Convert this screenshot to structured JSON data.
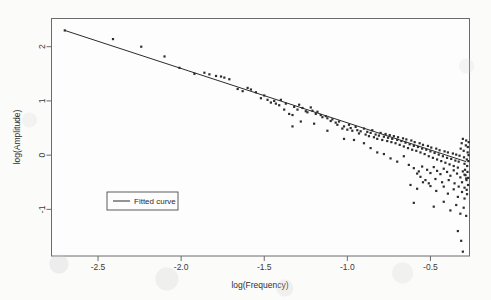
{
  "chart_data": {
    "type": "scatter",
    "title": "",
    "xlabel": "log(Frequency)",
    "ylabel": "log(Amplitude)",
    "xlim": [
      -2.78,
      -0.265
    ],
    "ylim": [
      -1.86,
      2.52
    ],
    "grid": false,
    "legend": {
      "position": "inner-left-lower",
      "entries": [
        {
          "label": "Fitted curve",
          "marker": "line",
          "color": "#2b2b2b"
        }
      ]
    },
    "xticks": [
      -2.5,
      -2.0,
      -1.5,
      -1.0,
      -0.5
    ],
    "xtick_labels": [
      "-2.5",
      "-2.0",
      "-1.5",
      "-1.0",
      "-0.5"
    ],
    "yticks": [
      2,
      1,
      0,
      -1
    ],
    "ytick_labels": [
      "2",
      "1",
      "0",
      "-1"
    ],
    "series": [
      {
        "name": "observations",
        "type": "scatter",
        "marker": "square",
        "marker_size": 2.2,
        "color": "#2d2d2d",
        "points": [
          [
            -2.7,
            2.3
          ],
          [
            -2.41,
            2.14
          ],
          [
            -2.24,
            2.0
          ],
          [
            -2.1,
            1.82
          ],
          [
            -2.01,
            1.61
          ],
          [
            -1.92,
            1.5
          ],
          [
            -1.86,
            1.52
          ],
          [
            -1.83,
            1.49
          ],
          [
            -1.79,
            1.46
          ],
          [
            -1.76,
            1.45
          ],
          [
            -1.74,
            1.43
          ],
          [
            -1.71,
            1.4
          ],
          [
            -1.66,
            1.22
          ],
          [
            -1.63,
            1.18
          ],
          [
            -1.6,
            1.24
          ],
          [
            -1.58,
            1.21
          ],
          [
            -1.55,
            1.16
          ],
          [
            -1.52,
            1.05
          ],
          [
            -1.5,
            1.1
          ],
          [
            -1.48,
            1.02
          ],
          [
            -1.46,
            0.97
          ],
          [
            -1.44,
            1.0
          ],
          [
            -1.43,
            0.95
          ],
          [
            -1.41,
            0.92
          ],
          [
            -1.4,
            1.02
          ],
          [
            -1.38,
            0.84
          ],
          [
            -1.37,
            0.95
          ],
          [
            -1.35,
            0.76
          ],
          [
            -1.33,
            0.74
          ],
          [
            -1.32,
            0.89
          ],
          [
            -1.3,
            0.84
          ],
          [
            -1.29,
            0.93
          ],
          [
            -1.27,
            0.87
          ],
          [
            -1.25,
            0.81
          ],
          [
            -1.24,
            0.79
          ],
          [
            -1.22,
            0.88
          ],
          [
            -1.21,
            0.82
          ],
          [
            -1.19,
            0.76
          ],
          [
            -1.18,
            0.8
          ],
          [
            -1.16,
            0.74
          ],
          [
            -1.15,
            0.7
          ],
          [
            -1.13,
            0.72
          ],
          [
            -1.12,
            0.68
          ],
          [
            -1.1,
            0.63
          ],
          [
            -1.09,
            0.66
          ],
          [
            -1.07,
            0.6
          ],
          [
            -1.06,
            0.56
          ],
          [
            -1.05,
            0.62
          ],
          [
            -1.03,
            0.49
          ],
          [
            -1.02,
            0.53
          ],
          [
            -1.0,
            0.47
          ],
          [
            -0.99,
            0.56
          ],
          [
            -0.98,
            0.5
          ],
          [
            -0.97,
            0.45
          ],
          [
            -0.95,
            0.52
          ],
          [
            -0.94,
            0.46
          ],
          [
            -0.93,
            0.4
          ],
          [
            -0.92,
            0.44
          ],
          [
            -0.9,
            0.49
          ],
          [
            -0.89,
            0.38
          ],
          [
            -0.88,
            0.43
          ],
          [
            -0.87,
            0.35
          ],
          [
            -0.86,
            0.41
          ],
          [
            -0.85,
            0.46
          ],
          [
            -0.84,
            0.33
          ],
          [
            -0.83,
            0.38
          ],
          [
            -0.82,
            0.3
          ],
          [
            -0.81,
            0.36
          ],
          [
            -0.8,
            0.41
          ],
          [
            -0.79,
            0.28
          ],
          [
            -0.78,
            0.34
          ],
          [
            -0.77,
            0.39
          ],
          [
            -0.76,
            0.26
          ],
          [
            -0.755,
            0.32
          ],
          [
            -0.745,
            0.37
          ],
          [
            -0.735,
            0.24
          ],
          [
            -0.73,
            0.3
          ],
          [
            -0.72,
            0.35
          ],
          [
            -0.71,
            0.22
          ],
          [
            -0.7,
            0.28
          ],
          [
            -0.695,
            0.33
          ],
          [
            -0.685,
            0.19
          ],
          [
            -0.675,
            0.26
          ],
          [
            -0.665,
            0.31
          ],
          [
            -0.66,
            0.16
          ],
          [
            -0.65,
            0.23
          ],
          [
            -0.645,
            0.29
          ],
          [
            -0.635,
            0.13
          ],
          [
            -0.625,
            0.2
          ],
          [
            -0.615,
            0.27
          ],
          [
            -0.61,
            0.1
          ],
          [
            -0.6,
            0.17
          ],
          [
            -0.595,
            0.24
          ],
          [
            -0.585,
            0.08
          ],
          [
            -0.575,
            0.15
          ],
          [
            -0.565,
            0.22
          ],
          [
            -0.56,
            0.05
          ],
          [
            -0.55,
            0.12
          ],
          [
            -0.545,
            0.19
          ],
          [
            -0.535,
            0.02
          ],
          [
            -0.525,
            0.1
          ],
          [
            -0.515,
            0.17
          ],
          [
            -0.51,
            -0.02
          ],
          [
            -0.5,
            0.07
          ],
          [
            -0.495,
            0.14
          ],
          [
            -0.485,
            -0.05
          ],
          [
            -0.475,
            0.04
          ],
          [
            -0.465,
            0.12
          ],
          [
            -0.46,
            -0.08
          ],
          [
            -0.45,
            0.01
          ],
          [
            -0.445,
            0.09
          ],
          [
            -0.435,
            -0.11
          ],
          [
            -0.425,
            -0.02
          ],
          [
            -0.415,
            0.07
          ],
          [
            -0.41,
            -0.14
          ],
          [
            -0.4,
            -0.05
          ],
          [
            -0.395,
            0.05
          ],
          [
            -0.385,
            -0.17
          ],
          [
            -0.375,
            -0.07
          ],
          [
            -0.365,
            0.03
          ],
          [
            -0.36,
            -0.2
          ],
          [
            -0.35,
            -0.1
          ],
          [
            -0.345,
            0.01
          ],
          [
            -0.335,
            -0.23
          ],
          [
            -0.33,
            -0.12
          ],
          [
            -0.325,
            -0.01
          ],
          [
            -0.318,
            0.12
          ],
          [
            -0.312,
            0.22
          ],
          [
            -0.305,
            0.3
          ],
          [
            -0.3,
            0.08
          ],
          [
            -0.298,
            -0.04
          ],
          [
            -0.295,
            -0.16
          ],
          [
            -0.292,
            -0.27
          ],
          [
            -0.289,
            -0.37
          ],
          [
            -0.287,
            0.18
          ],
          [
            -0.285,
            0.27
          ],
          [
            -0.283,
            -0.46
          ],
          [
            -0.281,
            -0.08
          ],
          [
            -0.279,
            -0.2
          ],
          [
            -0.277,
            -0.31
          ],
          [
            -0.276,
            0.05
          ],
          [
            -0.275,
            0.15
          ],
          [
            -0.274,
            -0.55
          ],
          [
            -0.273,
            -0.42
          ],
          [
            -0.272,
            -0.11
          ],
          [
            -0.271,
            0.0
          ],
          [
            -0.27,
            0.24
          ],
          [
            -1.33,
            0.53
          ],
          [
            -1.28,
            0.62
          ],
          [
            -1.2,
            0.58
          ],
          [
            -1.12,
            0.45
          ],
          [
            -1.02,
            0.3
          ],
          [
            -0.96,
            0.28
          ],
          [
            -0.9,
            0.22
          ],
          [
            -0.86,
            0.13
          ],
          [
            -0.82,
            0.05
          ],
          [
            -0.78,
            0.02
          ],
          [
            -0.74,
            -0.06
          ],
          [
            -0.7,
            -0.12
          ],
          [
            -0.66,
            -0.02
          ],
          [
            -0.63,
            -0.18
          ],
          [
            -0.6,
            -0.24
          ],
          [
            -0.57,
            -0.3
          ],
          [
            -0.55,
            -0.21
          ],
          [
            -0.52,
            -0.27
          ],
          [
            -0.5,
            -0.33
          ],
          [
            -0.48,
            -0.22
          ],
          [
            -0.46,
            -0.29
          ],
          [
            -0.44,
            -0.35
          ],
          [
            -0.42,
            -0.25
          ],
          [
            -0.4,
            -0.31
          ],
          [
            -0.38,
            -0.38
          ],
          [
            -0.36,
            -0.28
          ],
          [
            -0.34,
            -0.34
          ],
          [
            -0.32,
            -0.41
          ],
          [
            -0.305,
            -0.3
          ],
          [
            -0.295,
            -0.36
          ],
          [
            -0.285,
            -0.43
          ],
          [
            -0.62,
            -0.55
          ],
          [
            -0.58,
            -0.62
          ],
          [
            -0.545,
            -0.5
          ],
          [
            -0.5,
            -0.57
          ],
          [
            -0.465,
            -0.66
          ],
          [
            -0.42,
            -0.58
          ],
          [
            -0.395,
            -0.71
          ],
          [
            -0.36,
            -0.63
          ],
          [
            -0.335,
            -0.77
          ],
          [
            -0.31,
            -0.68
          ],
          [
            -0.295,
            -0.8
          ],
          [
            -0.28,
            -0.72
          ],
          [
            -0.6,
            -0.88
          ],
          [
            -0.48,
            -0.95
          ],
          [
            -0.42,
            -0.86
          ],
          [
            -0.38,
            -1.02
          ],
          [
            -0.345,
            -0.92
          ],
          [
            -0.32,
            -1.08
          ],
          [
            -0.3,
            -0.97
          ],
          [
            -0.285,
            -1.12
          ],
          [
            -0.335,
            -1.4
          ],
          [
            -0.315,
            -1.58
          ],
          [
            -0.305,
            -1.78
          ],
          [
            -0.56,
            -0.4
          ],
          [
            -0.53,
            -0.46
          ],
          [
            -0.58,
            -0.34
          ],
          [
            -0.51,
            -0.52
          ],
          [
            -0.47,
            -0.44
          ],
          [
            -0.43,
            -0.5
          ],
          [
            -0.39,
            -0.46
          ],
          [
            -0.355,
            -0.52
          ],
          [
            -0.33,
            -0.58
          ],
          [
            -0.31,
            -0.5
          ],
          [
            -0.295,
            -0.6
          ],
          [
            -0.282,
            -0.64
          ]
        ]
      }
    ],
    "fit_line": {
      "name": "Fitted curve",
      "type": "line",
      "color": "#2b2b2b",
      "width": 1,
      "x_start": -2.7,
      "y_start": 2.3,
      "x_end": -0.285,
      "y_end": -0.12,
      "slope": -1.003,
      "intercept": -0.408
    }
  }
}
